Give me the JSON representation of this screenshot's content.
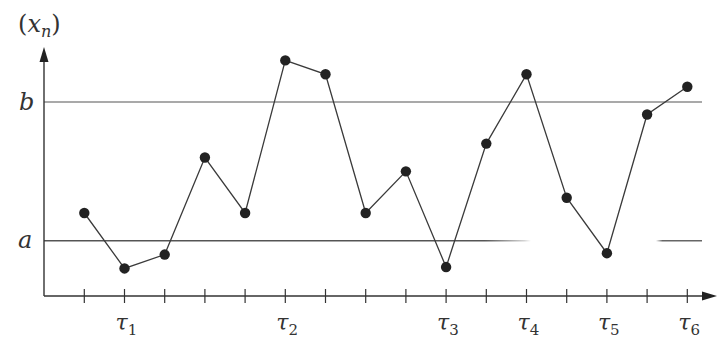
{
  "chart_data": {
    "type": "line",
    "title": "",
    "xlabel": "",
    "ylabel": "(x_n)",
    "y_axis_label": {
      "open": "(",
      "var": "x",
      "sub": "n",
      "close": ")"
    },
    "reference_lines": [
      {
        "name": "b",
        "value": 1.0
      },
      {
        "name": "a",
        "value": 0.0
      }
    ],
    "x": [
      0,
      1,
      2,
      3,
      4,
      5,
      6,
      7,
      8,
      9,
      10,
      11,
      12,
      13,
      14,
      15
    ],
    "values": [
      0.2,
      -0.2,
      -0.1,
      0.6,
      0.2,
      1.3,
      1.2,
      0.2,
      0.5,
      -0.19,
      0.7,
      1.2,
      0.31,
      -0.09,
      0.91,
      1.11
    ],
    "tick_labels": [
      {
        "index": 1,
        "main": "τ",
        "sub": "1"
      },
      {
        "index": 5,
        "main": "τ",
        "sub": "2"
      },
      {
        "index": 9,
        "main": "τ",
        "sub": "3"
      },
      {
        "index": 11,
        "main": "τ",
        "sub": "4"
      },
      {
        "index": 13,
        "main": "τ",
        "sub": "5"
      },
      {
        "index": 15,
        "main": "τ",
        "sub": "6"
      }
    ],
    "grid": false,
    "legend": null,
    "markers": "filled-circle",
    "colors": {
      "line": "#3a3a3a",
      "marker": "#222222",
      "axis": "#333333",
      "ref": "#555555"
    }
  }
}
